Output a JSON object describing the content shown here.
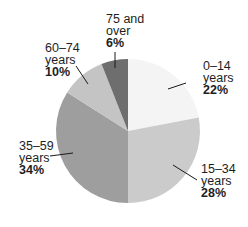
{
  "chart_data": {
    "type": "pie",
    "title": "",
    "start_angle_deg": 0,
    "direction": "clockwise",
    "center": [
      128,
      131
    ],
    "radius": 72,
    "slices": [
      {
        "label": "0–14 years",
        "range": "0–14",
        "unit": "years",
        "value": 22,
        "pct_label": "22%",
        "color": "#f4f4f4"
      },
      {
        "label": "15–34 years",
        "range": "15–34",
        "unit": "years",
        "value": 28,
        "pct_label": "28%",
        "color": "#cbcbcb"
      },
      {
        "label": "35–59 years",
        "range": "35–59",
        "unit": "years",
        "value": 34,
        "pct_label": "34%",
        "color": "#9e9e9e"
      },
      {
        "label": "60–74 years",
        "range": "60–74",
        "unit": "years",
        "value": 10,
        "pct_label": "10%",
        "color": "#c4c4c4"
      },
      {
        "label": "75 and over",
        "range": "75 and",
        "unit": "over",
        "value": 6,
        "pct_label": "6%",
        "color": "#6e6e6e"
      }
    ],
    "legend": "none (direct labels with leader lines)"
  },
  "labels": [
    {
      "line1": "0–14",
      "line2": "years",
      "line3": "22%",
      "x": 203,
      "y": 60,
      "leader": [
        [
          186,
          83
        ],
        [
          168,
          89
        ]
      ]
    },
    {
      "line1": "15–34",
      "line2": "years",
      "line3": "28%",
      "x": 201,
      "y": 163,
      "leader": [
        [
          197,
          180
        ],
        [
          173,
          165
        ]
      ]
    },
    {
      "line1": "35–59",
      "line2": "years",
      "line3": "34%",
      "x": 19,
      "y": 140,
      "leader": [
        [
          50,
          156
        ],
        [
          73,
          153
        ]
      ]
    },
    {
      "line1": "60–74",
      "line2": "years",
      "line3": "10%",
      "x": 45,
      "y": 42,
      "leader": [
        [
          76,
          66
        ],
        [
          88,
          84
        ]
      ]
    },
    {
      "line1": "75 and",
      "line2": "over",
      "line3": "6%",
      "x": 106,
      "y": 13,
      "leader": [
        [
          115,
          52
        ],
        [
          115,
          68
        ]
      ]
    }
  ]
}
